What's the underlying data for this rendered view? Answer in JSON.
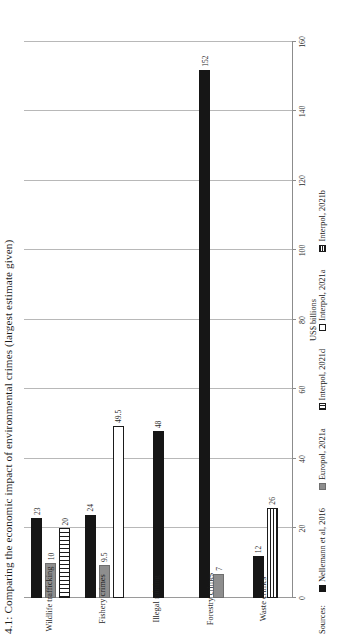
{
  "figure": {
    "title": "4.1: Comparing the economic impact of environmental crimes (largest estimate given)",
    "sources_label": "Sources:"
  },
  "chart_data": {
    "type": "bar",
    "orientation": "horizontal",
    "title": "4.1: Comparing the economic impact of environmental crimes (largest estimate given)",
    "xlabel": "",
    "ylabel": "US$ billions",
    "axis_title": "US$ billions",
    "ylim": [
      0,
      160
    ],
    "ticks": [
      "0",
      "20",
      "40",
      "60",
      "80",
      "100",
      "120",
      "140",
      "160"
    ],
    "tick_values": [
      0,
      20,
      40,
      60,
      80,
      100,
      120,
      140,
      160
    ],
    "grid": true,
    "legend_position": "bottom",
    "categories": [
      "Wildlife trafficking",
      "Fishery crimes",
      "Illegal mining",
      "Forestry crimes",
      "Waste crimes"
    ],
    "series": [
      {
        "name": "Nellemann et al, 2016",
        "pattern": "solid-black",
        "values": [
          23,
          24,
          48,
          152,
          12
        ]
      },
      {
        "name": "Europol, 2021a",
        "pattern": "solid-grey",
        "values": [
          10,
          9.5,
          null,
          7,
          null
        ]
      },
      {
        "name": "Interpol, 2021d",
        "pattern": "vertical-lines",
        "values": [
          20,
          null,
          null,
          null,
          null
        ]
      },
      {
        "name": "Interpol, 2021a",
        "pattern": "white",
        "values": [
          null,
          49.5,
          null,
          null,
          null
        ]
      },
      {
        "name": "Interpol, 2021b",
        "pattern": "horizontal-lines",
        "values": [
          null,
          null,
          null,
          null,
          26
        ]
      }
    ],
    "data_labels": {
      "Wildlife trafficking": [
        "23",
        "10",
        "20"
      ],
      "Fishery crimes": [
        "24",
        "9.5",
        "49.5"
      ],
      "Illegal mining": [
        "48"
      ],
      "Forestry crimes": [
        "152",
        "7"
      ],
      "Waste crimes": [
        "12",
        "26"
      ]
    }
  },
  "legend": {
    "items": [
      {
        "label": "Nellemann et al, 2016"
      },
      {
        "label": "Europol, 2021a"
      },
      {
        "label": "Interpol, 2021d"
      },
      {
        "label": "Interpol, 2021a"
      },
      {
        "label": "Interpol, 2021b"
      }
    ]
  }
}
